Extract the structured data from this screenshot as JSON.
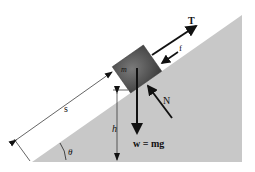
{
  "diagram": {
    "labels": {
      "tension": "T",
      "friction": "f",
      "normal": "N",
      "mass": "m",
      "weight": "w = mg",
      "distance": "s",
      "height": "h",
      "angle": "θ"
    },
    "colors": {
      "incline": "#c8c8c8",
      "block": "#5a5a5a",
      "arrow": "#111111"
    }
  }
}
